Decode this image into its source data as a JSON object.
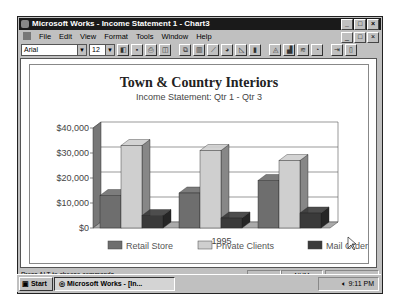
{
  "window": {
    "title": "Microsoft Works - Income Statement 1 - Chart3",
    "controls": [
      "_",
      "□",
      "×"
    ]
  },
  "menu": [
    "File",
    "Edit",
    "View",
    "Format",
    "Tools",
    "Window",
    "Help"
  ],
  "toolbar": {
    "font_name": "Arial",
    "font_size": "12",
    "buttons": [
      "task-launcher",
      "save",
      "print",
      "print-preview",
      "copy",
      "bar-chart",
      "line-chart",
      "pie-chart",
      "area-chart",
      "stacked-bar",
      "3d-area",
      "3d-bar",
      "3d-line",
      "3d-pie",
      "go-to-spreadsheet",
      "help"
    ]
  },
  "chart_data": {
    "type": "bar",
    "title": "Town & Country Interiors",
    "subtitle": "Income Statement: Qtr 1 - Qtr 3",
    "xlabel": "1995",
    "ylabel": "",
    "categories": [
      "Qtr 1",
      "Qtr 2",
      "Qtr 3"
    ],
    "series": [
      {
        "name": "Retail Store",
        "values": [
          13000,
          14000,
          19000
        ],
        "color": "#6e6e6e"
      },
      {
        "name": "Private Clients",
        "values": [
          33000,
          31000,
          27000
        ],
        "color": "#cfcfcf"
      },
      {
        "name": "Mail Order",
        "values": [
          5000,
          4000,
          6000
        ],
        "color": "#3a3a3a"
      }
    ],
    "yticks": [
      "$0",
      "$10,000",
      "$20,000",
      "$30,000",
      "$40,000"
    ],
    "ylim": [
      0,
      40000
    ],
    "grid": true,
    "style": "3d",
    "legend_position": "bottom"
  },
  "status": {
    "hint": "Press ALT to choose commands.",
    "num": "NUM"
  },
  "taskbar": {
    "start": "Start",
    "task": "Microsoft Works - [In...",
    "clock": "9:11 PM"
  }
}
